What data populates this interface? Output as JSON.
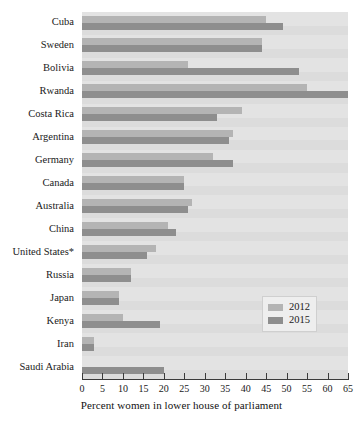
{
  "chart_data": {
    "type": "bar",
    "orientation": "horizontal",
    "title": "",
    "xlabel": "Percent women in lower house of parliament",
    "ylabel": "",
    "xlim": [
      0,
      65
    ],
    "xticks": [
      0,
      5,
      10,
      15,
      20,
      25,
      30,
      35,
      40,
      45,
      50,
      55,
      60,
      65
    ],
    "grid": false,
    "legend_position": "middle-right",
    "categories": [
      "Cuba",
      "Sweden",
      "Bolivia",
      "Rwanda",
      "Costa Rica",
      "Argentina",
      "Germany",
      "Canada",
      "Australia",
      "China",
      "United States*",
      "Russia",
      "Japan",
      "Kenya",
      "Iran",
      "Saudi Arabia"
    ],
    "series": [
      {
        "name": "2012",
        "color": "#b4b4b4",
        "values": [
          45,
          44,
          26,
          55,
          39,
          37,
          32,
          25,
          27,
          21,
          18,
          12,
          9,
          10,
          3,
          0
        ]
      },
      {
        "name": "2015",
        "color": "#8e8e8e",
        "values": [
          49,
          44,
          53,
          65,
          33,
          36,
          37,
          25,
          26,
          23,
          16,
          12,
          9,
          19,
          3,
          20
        ]
      }
    ]
  },
  "legend": {
    "entries": [
      {
        "label": "2012",
        "color": "#b4b4b4"
      },
      {
        "label": "2015",
        "color": "#8e8e8e"
      }
    ]
  },
  "axis": {
    "x_title": "Percent women in lower house of parliament",
    "tick_labels": [
      "0",
      "5",
      "10",
      "15",
      "20",
      "25",
      "30",
      "35",
      "40",
      "45",
      "50",
      "55",
      "60",
      "65"
    ]
  },
  "colors": {
    "series_2012": "#b4b4b4",
    "series_2015": "#8e8e8e",
    "plot_background": "#e3e3e3",
    "band_shade": "#dcdcdc",
    "axis": "#3a3a3a"
  }
}
